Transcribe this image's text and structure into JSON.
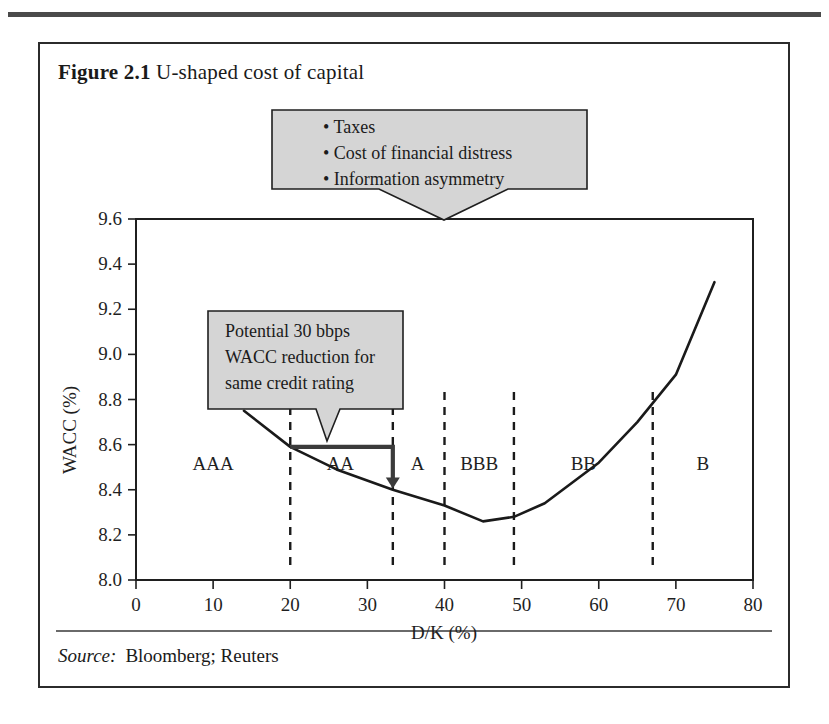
{
  "figure": {
    "number": "Figure 2.1",
    "title": "U-shaped cost of capital"
  },
  "source": {
    "label": "Source:",
    "value": "Bloomberg; Reuters"
  },
  "callouts": [
    {
      "name": "drivers-callout",
      "lines": [
        "• Taxes",
        "• Cost of financial distress",
        "• Information asymmetry"
      ]
    },
    {
      "name": "wacc-reduction-callout",
      "lines": [
        "Potential 30 bbps",
        "WACC reduction for",
        "same credit rating"
      ]
    }
  ],
  "chart_data": {
    "type": "line",
    "title": "U-shaped cost of capital",
    "xlabel": "D/K (%)",
    "ylabel": "WACC (%)",
    "xlim": [
      0,
      80
    ],
    "ylim": [
      8.0,
      9.6
    ],
    "xticks": [
      0,
      10,
      20,
      30,
      40,
      50,
      60,
      70,
      80
    ],
    "xtick_labels": [
      "0",
      "10",
      "20",
      "30",
      "40",
      "50",
      "60",
      "70",
      "80"
    ],
    "yticks": [
      8.0,
      8.2,
      8.4,
      8.6,
      8.8,
      9.0,
      9.2,
      9.4,
      9.6
    ],
    "ytick_labels": [
      "8.0",
      "8.2",
      "8.4",
      "8.6",
      "8.8",
      "9.0",
      "9.2",
      "9.4",
      "9.6"
    ],
    "grid": false,
    "legend": "none",
    "series": [
      {
        "name": "WACC",
        "x": [
          14,
          20,
          26,
          33.3,
          40,
          45,
          49,
          53,
          60,
          65,
          70,
          75
        ],
        "values": [
          8.75,
          8.59,
          8.49,
          8.4,
          8.33,
          8.26,
          8.28,
          8.34,
          8.52,
          8.7,
          8.91,
          9.32
        ]
      }
    ],
    "rating_bands": [
      {
        "label": "AAA",
        "x_center": 10,
        "x_end": 20
      },
      {
        "label": "AA",
        "x_center": 26.5,
        "x_end": 33.3
      },
      {
        "label": "A",
        "x_center": 36.5,
        "x_end": 40
      },
      {
        "label": "BBB",
        "x_center": 44.5,
        "x_end": 49
      },
      {
        "label": "BB",
        "x_center": 58,
        "x_end": 67
      },
      {
        "label": "B",
        "x_center": 73.5,
        "x_end": 80
      }
    ],
    "band_dividers": [
      20,
      33.3,
      40,
      49,
      67
    ],
    "annotations": [
      {
        "name": "wacc-reduction-arrow",
        "from": {
          "x": 20,
          "y": 8.59
        },
        "to": {
          "x": 33.3,
          "y": 8.405
        },
        "note": "Potential 30 bbps WACC reduction for same credit rating"
      }
    ]
  }
}
